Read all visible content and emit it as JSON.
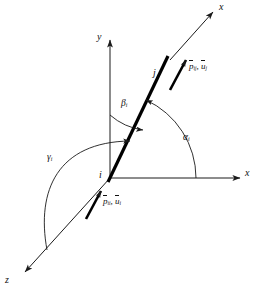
{
  "figure": {
    "type": "3d-coordinate-direction-cosine-diagram",
    "stroke_color": "#1a1a1a",
    "member_color": "#000000",
    "background": "#ffffff"
  },
  "axes": [
    {
      "id": "x-global",
      "label": "x",
      "direction": "right",
      "tip": [
        248,
        175
      ]
    },
    {
      "id": "y-global",
      "label": "y",
      "direction": "up",
      "tip": [
        112,
        33
      ]
    },
    {
      "id": "z-global",
      "label": "z",
      "direction": "down-left",
      "tip": [
        20,
        276
      ]
    },
    {
      "id": "x-local",
      "label": "x",
      "direction": "up-right",
      "tip": [
        215,
        8
      ]
    }
  ],
  "axis_labels": {
    "x_global": "x",
    "y_global": "y",
    "z_global": "z",
    "x_local": "x"
  },
  "nodes": [
    {
      "id": "i",
      "label": "i",
      "role": "origin-node",
      "position": [
        110,
        178
      ]
    },
    {
      "id": "j",
      "label": "j",
      "role": "far-node",
      "position": [
        157,
        74
      ]
    }
  ],
  "angles": [
    {
      "id": "alpha",
      "symbol": "α",
      "subscript": "i",
      "measured_from": "x-global",
      "to": "member"
    },
    {
      "id": "beta",
      "symbol": "β",
      "subscript": "i",
      "measured_from": "y-global",
      "to": "member"
    },
    {
      "id": "gamma",
      "symbol": "γ",
      "subscript": "i",
      "measured_from": "z-global",
      "to": "member"
    }
  ],
  "vectors": [
    {
      "id": "vector-j",
      "force_symbol": "p",
      "force_overbar": true,
      "force_subscript": "ij",
      "disp_symbol": "u",
      "disp_overbar": true,
      "disp_subscript": "j",
      "separator": ", ",
      "at_node": "j",
      "direction": "along-member-positive"
    },
    {
      "id": "vector-i",
      "force_symbol": "p",
      "force_overbar": true,
      "force_subscript": "ii",
      "disp_symbol": "u",
      "disp_overbar": true,
      "disp_subscript": "i",
      "separator": ", ",
      "at_node": "i",
      "direction": "along-member-positive"
    }
  ]
}
